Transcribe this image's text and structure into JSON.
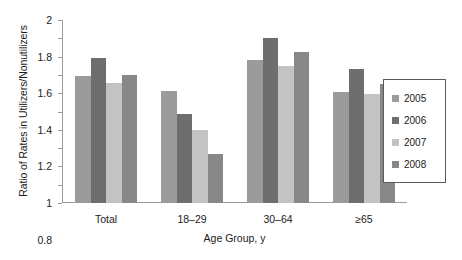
{
  "chart_data": {
    "type": "bar",
    "title": "",
    "xlabel": "Age Group, y",
    "ylabel": "Ratio of Rates in Utilizers/Nonutilizers",
    "categories": [
      "Total",
      "18–29",
      "30–64",
      "≥65"
    ],
    "series": [
      {
        "name": "2005",
        "color": "#9b9b9b",
        "values": [
          1.39,
          1.22,
          1.56,
          1.21
        ]
      },
      {
        "name": "2006",
        "color": "#6e6e6e",
        "values": [
          1.59,
          0.97,
          1.8,
          1.46
        ]
      },
      {
        "name": "2007",
        "color": "#c3c3c3",
        "values": [
          1.31,
          0.8,
          1.5,
          1.19
        ]
      },
      {
        "name": "2008",
        "color": "#878787",
        "values": [
          1.4,
          0.54,
          1.65,
          1.3
        ]
      }
    ],
    "ylim": [
      0,
      2
    ],
    "ytick_step": 0.2,
    "yticks": [
      "0",
      "0.2",
      "0.4",
      "0.6",
      "0.8",
      "1",
      "1.2",
      "1.4",
      "1.6",
      "1.8",
      "2"
    ],
    "grid": false,
    "legend_position": "right",
    "legend_entries": [
      "2005",
      "2006",
      "2007",
      "2008"
    ]
  }
}
